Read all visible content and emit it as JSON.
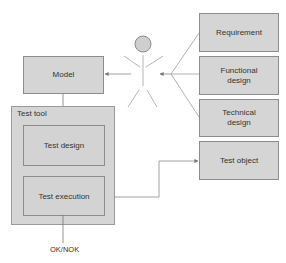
{
  "diagram": {
    "actor": {
      "name": "user-actor"
    },
    "model": {
      "label": "Model"
    },
    "test_tool": {
      "label": "Test tool",
      "test_design": {
        "label": "Test design"
      },
      "test_execution": {
        "label": "Test execution"
      }
    },
    "sources": [
      {
        "label": "Requirement"
      },
      {
        "label": "Functional design"
      },
      {
        "label": "Technical design"
      }
    ],
    "test_object": {
      "label": "Test object"
    },
    "output": {
      "label": "OK/NOK"
    },
    "colors": {
      "box_fill": "#d5d5d5",
      "box_border": "#8c8c8c",
      "line": "#8a8a8a",
      "text": "#333333"
    }
  }
}
